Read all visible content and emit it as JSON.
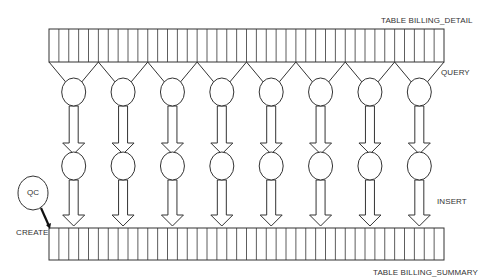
{
  "labels": {
    "table_detail": "TABLE BILLING_DETAIL",
    "query": "QUERY",
    "insert": "INSERT",
    "create": "CREATE",
    "qc": "QC",
    "table_summary": "TABLE BILLING_SUMMARY"
  },
  "layout": {
    "stroke_color": "#333333",
    "background": "#ffffff",
    "parallel_streams": 8,
    "table_stripes": 40
  },
  "nodes": {
    "source_table": "TABLE BILLING_DETAIL",
    "target_table": "TABLE BILLING_SUMMARY",
    "query_processes": 8,
    "insert_processes": 8,
    "coordinator": "QC"
  },
  "edges": [
    {
      "from": "TABLE BILLING_DETAIL",
      "to": "query processes (8)",
      "label": "QUERY"
    },
    {
      "from": "query processes (8)",
      "to": "insert processes (8)",
      "label": ""
    },
    {
      "from": "insert processes (8)",
      "to": "TABLE BILLING_SUMMARY",
      "label": "INSERT"
    },
    {
      "from": "QC",
      "to": "TABLE BILLING_SUMMARY",
      "label": "CREATE"
    }
  ]
}
